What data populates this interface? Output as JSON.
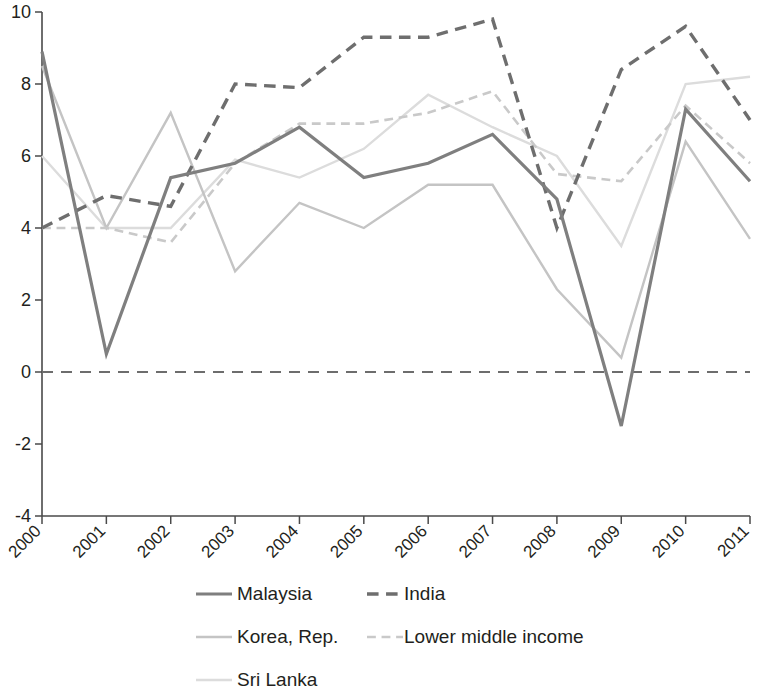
{
  "chart_data": {
    "type": "line",
    "title": "",
    "subtitle": "",
    "xlabel": "",
    "ylabel": "",
    "grid": false,
    "legend_position": "bottom",
    "categories": [
      "2000",
      "2001",
      "2002",
      "2003",
      "2004",
      "2005",
      "2006",
      "2007",
      "2008",
      "2009",
      "2010",
      "2011"
    ],
    "x": [
      2000,
      2001,
      2002,
      2003,
      2004,
      2005,
      2006,
      2007,
      2008,
      2009,
      2010,
      2011
    ],
    "xlim": [
      2000,
      2011
    ],
    "ylim": [
      -4,
      10
    ],
    "ytick_labels": [
      "10",
      "8",
      "6",
      "4",
      "2",
      "0",
      "-2",
      "-4"
    ],
    "yticks": [
      10,
      8,
      6,
      4,
      2,
      0,
      -2,
      -4
    ],
    "zero_reference_line": 0,
    "series": [
      {
        "name": "Malaysia",
        "style": "solid",
        "color": "#7f7f7f",
        "width": 3.2,
        "values": [
          8.9,
          0.5,
          5.4,
          5.8,
          6.8,
          5.4,
          5.8,
          6.6,
          4.8,
          -1.5,
          7.3,
          5.3
        ]
      },
      {
        "name": "India",
        "style": "dashed",
        "color": "#6e6e6e",
        "width": 3.4,
        "values": [
          4.0,
          4.9,
          4.6,
          8.0,
          7.9,
          9.3,
          9.3,
          9.8,
          4.0,
          8.4,
          9.6,
          7.0
        ]
      },
      {
        "name": "Korea, Rep.",
        "style": "solid",
        "color": "#c4c4c4",
        "width": 2.4,
        "values": [
          8.5,
          4.0,
          7.2,
          2.8,
          4.7,
          4.0,
          5.2,
          5.2,
          2.3,
          0.4,
          6.4,
          3.7
        ]
      },
      {
        "name": "Lower middle income",
        "style": "dashed",
        "color": "#c9c9c9",
        "width": 2.6,
        "values": [
          4.0,
          4.0,
          3.6,
          5.8,
          6.9,
          6.9,
          7.2,
          7.8,
          5.5,
          5.3,
          7.4,
          5.8
        ]
      },
      {
        "name": "Sri Lanka",
        "style": "solid",
        "color": "#dcdcdc",
        "width": 2.4,
        "values": [
          6.0,
          4.0,
          4.0,
          5.9,
          5.4,
          6.2,
          7.7,
          6.8,
          6.0,
          3.5,
          8.0,
          8.2
        ]
      }
    ]
  },
  "legend": {
    "entries": [
      {
        "label": "Malaysia",
        "style": "solid",
        "color": "#7f7f7f"
      },
      {
        "label": "India",
        "style": "dashed",
        "color": "#6e6e6e"
      },
      {
        "label": "Korea, Rep.",
        "style": "solid",
        "color": "#c4c4c4"
      },
      {
        "label": "Lower middle income",
        "style": "dashed",
        "color": "#c9c9c9"
      },
      {
        "label": "Sri Lanka",
        "style": "solid",
        "color": "#dcdcdc"
      }
    ]
  }
}
